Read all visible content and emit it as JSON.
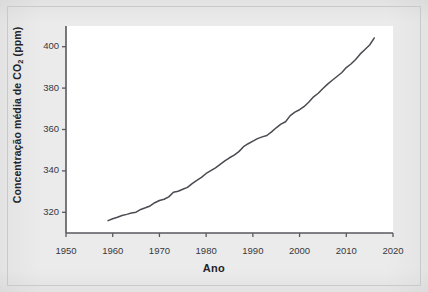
{
  "figure": {
    "background_color": "#ebebeb",
    "plot_background_color": "#ffffff",
    "frame_color": "#c9c9c9",
    "axis_color": "#58585e",
    "line_color": "#4a4a52"
  },
  "chart_data": {
    "type": "line",
    "title": "",
    "xlabel": "Ano",
    "ylabel": "Concentração média de CO₂ (ppm)",
    "ylabel_parts": {
      "before": "Concentração média de CO",
      "subscript": "2",
      "after": " (ppm)"
    },
    "xlim": [
      1950,
      2020
    ],
    "ylim": [
      310,
      410
    ],
    "xticks": [
      1950,
      1960,
      1970,
      1980,
      1990,
      2000,
      2010,
      2020
    ],
    "xtick_labels": [
      "1950",
      "1960",
      "1970",
      "1980",
      "1990",
      "2000",
      "2010",
      "2020"
    ],
    "yticks": [
      320,
      340,
      360,
      380,
      400
    ],
    "ytick_labels": [
      "320",
      "340",
      "360",
      "380",
      "400"
    ],
    "grid": false,
    "legend": false,
    "series": [
      {
        "name": "Concentração média de CO2",
        "units": "ppm",
        "x": [
          1959,
          1960,
          1961,
          1962,
          1963,
          1964,
          1965,
          1966,
          1967,
          1968,
          1969,
          1970,
          1971,
          1972,
          1973,
          1974,
          1975,
          1976,
          1977,
          1978,
          1979,
          1980,
          1981,
          1982,
          1983,
          1984,
          1985,
          1986,
          1987,
          1988,
          1989,
          1990,
          1991,
          1992,
          1993,
          1994,
          1995,
          1996,
          1997,
          1998,
          1999,
          2000,
          2001,
          2002,
          2003,
          2004,
          2005,
          2006,
          2007,
          2008,
          2009,
          2010,
          2011,
          2012,
          2013,
          2014,
          2015,
          2016
        ],
        "values": [
          315.97,
          316.91,
          317.64,
          318.45,
          318.99,
          319.62,
          320.04,
          321.37,
          322.18,
          323.05,
          324.62,
          325.68,
          326.32,
          327.46,
          329.68,
          330.19,
          331.12,
          332.03,
          333.84,
          335.41,
          336.84,
          338.76,
          340.12,
          341.48,
          343.15,
          344.85,
          346.35,
          347.61,
          349.31,
          351.69,
          353.12,
          354.39,
          355.61,
          356.45,
          357.1,
          358.83,
          360.82,
          362.61,
          363.73,
          366.7,
          368.38,
          369.55,
          371.14,
          373.28,
          375.8,
          377.52,
          379.8,
          381.9,
          383.79,
          385.6,
          387.43,
          389.9,
          391.65,
          393.85,
          396.52,
          398.65,
          400.83,
          404.24
        ]
      }
    ]
  }
}
